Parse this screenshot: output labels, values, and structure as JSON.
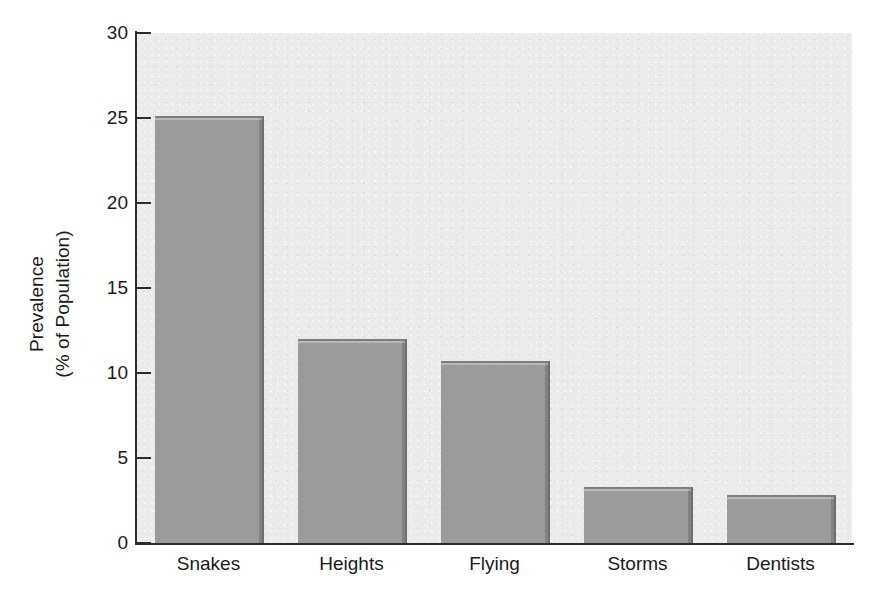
{
  "chart_data": {
    "type": "bar",
    "title": "",
    "subtitle": "",
    "xlabel": "",
    "ylabel": "Prevalence\n(% of Population)",
    "ylabel_lines": [
      "Prevalence",
      "(% of Population)"
    ],
    "categories": [
      "Snakes",
      "Heights",
      "Flying",
      "Storms",
      "Dentists"
    ],
    "values": [
      25.0,
      11.9,
      10.6,
      3.2,
      2.7
    ],
    "ylim": [
      0,
      30
    ],
    "yticks": [
      0,
      5,
      10,
      15,
      20,
      25,
      30
    ],
    "ytick_labels": [
      "0",
      "5",
      "10",
      "15",
      "20",
      "25",
      "30"
    ],
    "grid": false,
    "legend": null,
    "legend_position": "none",
    "bar_color": "#9b9b9b",
    "plot_background": "#ebebeb",
    "axis_color": "#2b2b2b",
    "text_color": "#1a1a1a"
  }
}
